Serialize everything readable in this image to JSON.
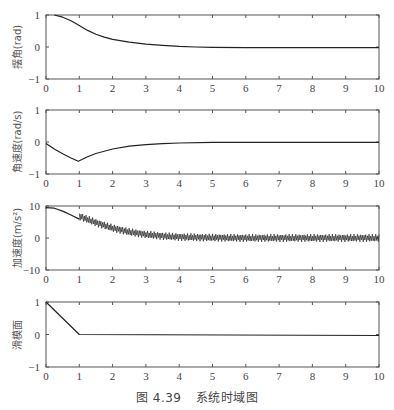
{
  "figure": {
    "caption_number": "图 4.39",
    "caption_text": "系统时域图"
  },
  "chart_data": [
    {
      "type": "line",
      "title": "",
      "xlabel": "",
      "ylabel": "摆角(rad)",
      "xlim": [
        0,
        10
      ],
      "ylim": [
        -1,
        1
      ],
      "xticks": [
        "0",
        "1",
        "2",
        "3",
        "4",
        "5",
        "6",
        "7",
        "8",
        "9",
        "10"
      ],
      "yticks": [
        "-1",
        "0",
        "1"
      ],
      "grid": false,
      "series": [
        {
          "name": "摆角",
          "x": [
            0.25,
            0.5,
            0.75,
            1.0,
            1.25,
            1.5,
            1.75,
            2.0,
            2.5,
            3.0,
            3.5,
            4.0,
            4.5,
            5.0,
            6.0,
            7.0,
            8.0,
            9.0,
            10.0
          ],
          "y": [
            1.0,
            0.93,
            0.82,
            0.67,
            0.52,
            0.4,
            0.31,
            0.24,
            0.15,
            0.09,
            0.05,
            0.02,
            0.0,
            -0.01,
            -0.02,
            -0.02,
            -0.02,
            -0.02,
            -0.02
          ]
        }
      ]
    },
    {
      "type": "line",
      "title": "",
      "xlabel": "",
      "ylabel": "角速度(rad/s)",
      "xlim": [
        0,
        10
      ],
      "ylim": [
        -1,
        1
      ],
      "xticks": [
        "0",
        "1",
        "2",
        "3",
        "4",
        "5",
        "6",
        "7",
        "8",
        "9",
        "10"
      ],
      "yticks": [
        "-1",
        "0",
        "1"
      ],
      "grid": false,
      "series": [
        {
          "name": "角速度",
          "x": [
            0,
            0.25,
            0.5,
            0.75,
            0.97,
            1.25,
            1.5,
            2.0,
            2.5,
            3.0,
            3.5,
            4.0,
            5.0,
            6.0,
            8.0,
            10.0
          ],
          "y": [
            -0.05,
            -0.22,
            -0.37,
            -0.5,
            -0.6,
            -0.46,
            -0.36,
            -0.22,
            -0.13,
            -0.08,
            -0.05,
            -0.03,
            -0.01,
            -0.01,
            -0.01,
            -0.01
          ]
        }
      ]
    },
    {
      "type": "line",
      "title": "",
      "xlabel": "",
      "ylabel": "加速度(m/s²)",
      "xlim": [
        0,
        10
      ],
      "ylim": [
        -10,
        10
      ],
      "xticks": [
        "0",
        "1",
        "2",
        "3",
        "4",
        "5",
        "6",
        "7",
        "8",
        "9",
        "10"
      ],
      "yticks": [
        "-10",
        "0",
        "10"
      ],
      "grid": false,
      "series": [
        {
          "name": "加速度(平滑段)",
          "x": [
            0,
            0.25,
            0.5,
            0.75,
            1.0
          ],
          "y": [
            9.5,
            9.3,
            8.4,
            7.2,
            5.9
          ]
        },
        {
          "name": "加速度(抖振包络中心)",
          "x": [
            1.0,
            1.5,
            2.0,
            2.5,
            3.0,
            3.5,
            4.0,
            5.0,
            6.0,
            7.0,
            8.0,
            9.0,
            10.0
          ],
          "y": [
            6.8,
            4.8,
            3.1,
            1.9,
            1.1,
            0.6,
            0.3,
            0.1,
            0.0,
            0.0,
            0.0,
            0.0,
            0.0
          ],
          "chatter_amplitude": 1.2
        }
      ]
    },
    {
      "type": "line",
      "title": "",
      "xlabel": "",
      "ylabel": "滑模面",
      "xlim": [
        0,
        10
      ],
      "ylim": [
        -1,
        1
      ],
      "xticks": [
        "0",
        "1",
        "2",
        "3",
        "4",
        "5",
        "6",
        "7",
        "8",
        "9",
        "10"
      ],
      "yticks": [
        "-1",
        "0",
        "1"
      ],
      "grid": false,
      "series": [
        {
          "name": "滑模面",
          "x": [
            0,
            1.0,
            10.0
          ],
          "y": [
            1.0,
            0.0,
            -0.03
          ]
        }
      ]
    }
  ]
}
